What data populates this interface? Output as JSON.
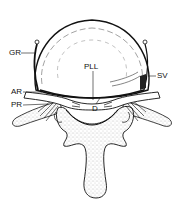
{
  "figure": {
    "type": "anatomical line drawing",
    "colors": {
      "ink": "#111111",
      "stipple": "#9a9a9a",
      "background": "#ffffff"
    },
    "labels": [
      {
        "id": "GR",
        "text": "GR",
        "x": 9,
        "y": 49
      },
      {
        "id": "AR",
        "text": "AR",
        "x": 11,
        "y": 88
      },
      {
        "id": "PR",
        "text": "PR",
        "x": 11,
        "y": 101
      },
      {
        "id": "SV",
        "text": "SV",
        "x": 157,
        "y": 72
      },
      {
        "id": "PLL",
        "text": "PLL",
        "x": 84,
        "y": 63
      },
      {
        "id": "D",
        "text": "D",
        "x": 92,
        "y": 105
      }
    ]
  }
}
